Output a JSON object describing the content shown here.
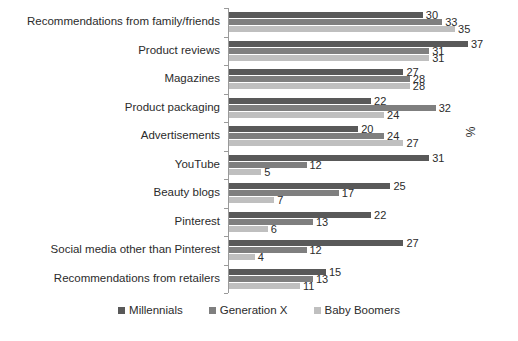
{
  "chart_data": {
    "type": "bar",
    "orientation": "horizontal",
    "title": "",
    "subtitle": "",
    "xlabel": "%",
    "ylabel": "",
    "grid": false,
    "legend_position": "bottom",
    "xlim": [
      0,
      40
    ],
    "categories": [
      "Recommendations from family/friends",
      "Product reviews",
      "Magazines",
      "Product packaging",
      "Advertisements",
      "YouTube",
      "Beauty blogs",
      "Pinterest",
      "Social media other than Pinterest",
      "Recommendations from retailers"
    ],
    "series": [
      {
        "name": "Millennials",
        "color": "#595959",
        "values": [
          30,
          37,
          27,
          22,
          20,
          31,
          25,
          22,
          27,
          15
        ]
      },
      {
        "name": "Generation X",
        "color": "#7f7f7f",
        "values": [
          33,
          31,
          28,
          32,
          24,
          12,
          17,
          13,
          12,
          13
        ]
      },
      {
        "name": "Baby Boomers",
        "color": "#bfbfbf",
        "values": [
          35,
          31,
          28,
          24,
          27,
          5,
          7,
          6,
          4,
          11
        ]
      }
    ]
  }
}
